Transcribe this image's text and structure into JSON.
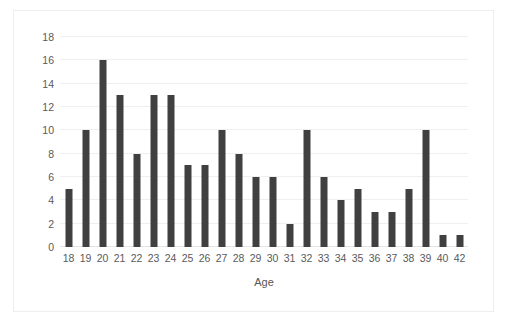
{
  "chart_data": {
    "type": "bar",
    "title": "",
    "subtitle": "",
    "xlabel": "Age",
    "ylabel": "",
    "categories": [
      "18",
      "19",
      "20",
      "21",
      "22",
      "23",
      "24",
      "25",
      "26",
      "27",
      "28",
      "29",
      "30",
      "31",
      "32",
      "33",
      "34",
      "35",
      "36",
      "37",
      "38",
      "39",
      "40",
      "42"
    ],
    "values": [
      5,
      10,
      16,
      13,
      8,
      13,
      13,
      7,
      7,
      10,
      8,
      6,
      6,
      2,
      10,
      6,
      4,
      5,
      3,
      3,
      5,
      10,
      1,
      1
    ],
    "ylim": [
      0,
      18
    ],
    "ytick_values": [
      0,
      2,
      4,
      6,
      8,
      10,
      12,
      14,
      16,
      18
    ],
    "ytick_labels": [
      "0",
      "2",
      "4",
      "6",
      "8",
      "10",
      "12",
      "14",
      "16",
      "18"
    ],
    "grid": "horizontal",
    "legend": "none",
    "bar_color": "#404040",
    "gridline_color": "#efefef",
    "axis_text_color": "#5a5a5a",
    "plot_background": "#ffffff",
    "frame_color": "#eceff1"
  }
}
